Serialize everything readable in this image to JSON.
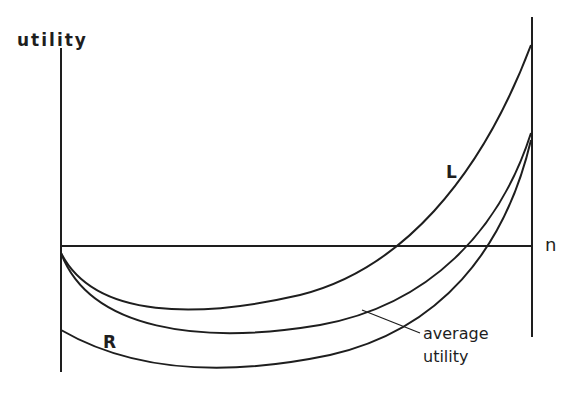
{
  "diagram": {
    "y_axis_label": "utility",
    "x_axis_label": "n",
    "curves": [
      {
        "name": "L",
        "label": "L",
        "description": "upper curve, rises steeply to right"
      },
      {
        "name": "average",
        "label": "average utility",
        "description": "middle curve"
      },
      {
        "name": "R",
        "label": "R",
        "description": "lower curve starting below origin"
      }
    ],
    "annotation": {
      "line1": "average",
      "line2": "utility"
    },
    "colors": {
      "ink": "#1e1e1e",
      "background": "#ffffff"
    }
  }
}
